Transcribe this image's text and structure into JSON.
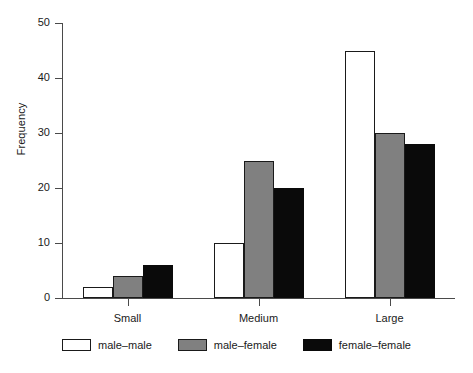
{
  "chart_data": {
    "type": "bar",
    "title": "",
    "xlabel": "",
    "ylabel": "Frequency",
    "categories": [
      "Small",
      "Medium",
      "Large"
    ],
    "series": [
      {
        "name": "male–male",
        "color": "#ffffff",
        "values": [
          2,
          10,
          45
        ]
      },
      {
        "name": "male–female",
        "color": "#808080",
        "values": [
          4,
          25,
          30
        ]
      },
      {
        "name": "female–female",
        "color": "#0a0a0a",
        "values": [
          6,
          20,
          28
        ]
      }
    ],
    "ylim": [
      0,
      50
    ],
    "yticks": [
      0,
      10,
      20,
      30,
      40,
      50
    ],
    "ytick_labels": [
      "0",
      "10",
      "20",
      "30",
      "40",
      "50"
    ],
    "grid": false,
    "legend_position": "bottom"
  },
  "axes": {
    "y_axis_title": "Frequency"
  }
}
